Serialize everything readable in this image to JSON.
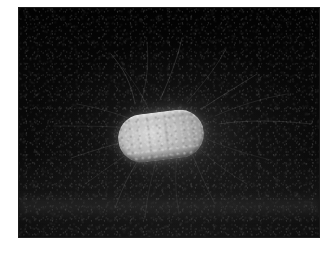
{
  "figure": {
    "kind": "electron-micrograph",
    "caption": "",
    "page_background": "#ffffff",
    "field": {
      "background_color": "#050505",
      "left": 19,
      "top": 8,
      "width": 300,
      "height": 229,
      "border_color": "#1a1a1a"
    },
    "cell": {
      "label": "bacterial-cell",
      "shape": "capsule",
      "fill_color": "#bdbdbd",
      "rim_color": "#e8e8e8",
      "left": 99,
      "top": 104,
      "width": 86,
      "height": 48,
      "rotation_deg": -7
    },
    "appendages": {
      "label": "flagella",
      "color": "#8f8f8f",
      "count": 18,
      "paths": [
        {
          "d": "M 92 46 C 104 60, 112 74, 116 96",
          "w": 0.6,
          "o": 0.45
        },
        {
          "d": "M 128 34 C 130 56, 128 74, 122 94",
          "w": 0.5,
          "o": 0.4
        },
        {
          "d": "M 163 30 C 158 52, 150 72, 141 92",
          "w": 0.6,
          "o": 0.42
        },
        {
          "d": "M 207 41 C 197 60, 182 78, 168 94",
          "w": 0.5,
          "o": 0.38
        },
        {
          "d": "M 238 66 C 222 76, 202 88, 184 100",
          "w": 0.6,
          "o": 0.4
        },
        {
          "d": "M 268 86 C 244 90, 218 98, 196 108",
          "w": 0.5,
          "o": 0.34
        },
        {
          "d": "M 292 116 C 258 112, 226 112, 200 116",
          "w": 0.6,
          "o": 0.36
        },
        {
          "d": "M 58 96 C 80 100, 100 106, 114 112",
          "w": 0.5,
          "o": 0.36
        },
        {
          "d": "M 34 118 C 62 118, 88 118, 110 120",
          "w": 0.5,
          "o": 0.3
        },
        {
          "d": "M 52 150 C 76 142, 96 136, 112 132",
          "w": 0.6,
          "o": 0.34
        },
        {
          "d": "M 66 176 C 86 162, 104 148, 118 140",
          "w": 0.5,
          "o": 0.32
        },
        {
          "d": "M 96 200 C 104 178, 114 158, 124 146",
          "w": 0.6,
          "o": 0.34
        },
        {
          "d": "M 126 210 C 128 186, 134 164, 138 150",
          "w": 0.5,
          "o": 0.3
        },
        {
          "d": "M 160 206 C 156 184, 156 164, 158 150",
          "w": 0.5,
          "o": 0.28
        },
        {
          "d": "M 196 196 C 186 176, 178 158, 174 148",
          "w": 0.6,
          "o": 0.3
        },
        {
          "d": "M 228 176 C 208 164, 192 152, 182 142",
          "w": 0.5,
          "o": 0.28
        },
        {
          "d": "M 252 152 C 226 146, 204 138, 190 132",
          "w": 0.5,
          "o": 0.26
        },
        {
          "d": "M 104 60 C 118 78, 126 92, 130 102",
          "w": 0.5,
          "o": 0.3
        }
      ]
    }
  }
}
